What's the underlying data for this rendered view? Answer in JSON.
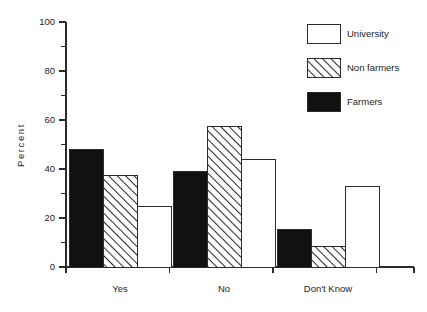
{
  "chart_data": {
    "type": "bar",
    "title": "",
    "subtitle": "",
    "xlabel": "",
    "ylabel": "Percent",
    "categories": [
      "Yes",
      "No",
      "Don't Know"
    ],
    "series": [
      {
        "name": "Farmers",
        "values": [
          48,
          39,
          15.5
        ],
        "fill": "#111111",
        "pattern": "solid"
      },
      {
        "name": "Non farmers",
        "values": [
          37.5,
          57.5,
          8.5
        ],
        "fill": "#ffffff",
        "pattern": "diagonal-hatch"
      },
      {
        "name": "University",
        "values": [
          24.5,
          44,
          33
        ],
        "fill": "#ffffff",
        "pattern": "none"
      }
    ],
    "ylim": [
      0,
      100
    ],
    "y_major_ticks": [
      0,
      20,
      40,
      60,
      80,
      100
    ],
    "y_minor_ticks": [
      10,
      30,
      50,
      70,
      90
    ],
    "y_tick_labels": [
      "0",
      "20",
      "40",
      "60",
      "80",
      "100"
    ],
    "grid": false,
    "legend": {
      "position": "top-right",
      "entries": [
        {
          "label": "University",
          "swatch": "white-box"
        },
        {
          "label": "Non farmers",
          "swatch": "hatched-box"
        },
        {
          "label": "Farmers",
          "swatch": "black-box"
        }
      ]
    },
    "colors": {
      "axis": "#2b2b2b",
      "text": "#1c1c1c",
      "farmers": "#111111",
      "non_farmers_fill": "#ffffff",
      "non_farmers_hatch": "#2b2b2b",
      "university": "#ffffff",
      "background": "#ffffff"
    }
  }
}
